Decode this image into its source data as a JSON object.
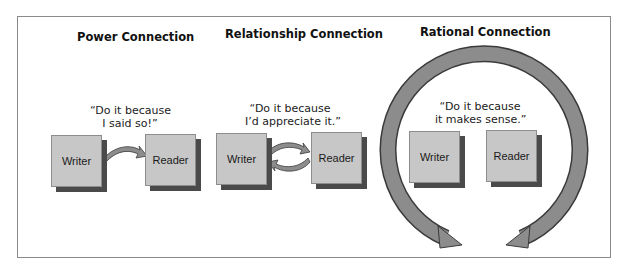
{
  "panels": [
    {
      "heading": "Power Connection",
      "quote_line1": "“Do it because",
      "quote_line2": "I said so!”",
      "writer": "Writer",
      "reader": "Reader",
      "arrow": "one-way"
    },
    {
      "heading": "Relationship Connection",
      "quote_line1": "“Do it because",
      "quote_line2": "I’d appreciate it.”",
      "writer": "Writer",
      "reader": "Reader",
      "arrow": "two-way"
    },
    {
      "heading": "Rational Connection",
      "quote_line1": "“Do it because",
      "quote_line2": "it makes sense.”",
      "writer": "Writer",
      "reader": "Reader",
      "arrow": "circular"
    }
  ],
  "colors": {
    "box_fill": "#c7c7c7",
    "box_shadow": "#4a4a4a",
    "arrow_fill": "#8c8c8c",
    "arrow_edge": "#3a3a3a",
    "frame": "#8a8a8a"
  }
}
